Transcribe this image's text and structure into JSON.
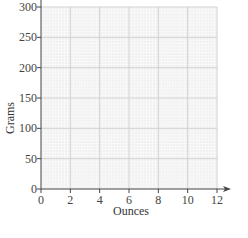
{
  "chart_data": {
    "type": "line",
    "title": "",
    "xlabel": "Ounces",
    "ylabel": "Grams",
    "xlim": [
      0,
      12
    ],
    "ylim": [
      0,
      300
    ],
    "x_ticks": [
      0,
      2,
      4,
      6,
      8,
      10,
      12
    ],
    "y_ticks": [
      0,
      50,
      100,
      150,
      200,
      250,
      300
    ],
    "x_tick_labels": [
      "0",
      "2",
      "4",
      "6",
      "8",
      "10",
      "12"
    ],
    "y_tick_labels": [
      "0",
      "50",
      "100",
      "150",
      "200",
      "250",
      "300"
    ],
    "grid": true,
    "grid_style": "graph paper: major lines every 2 ounces and 50 grams, with fine minor subdivisions",
    "x_axis_arrow": true,
    "legend": null,
    "series": []
  },
  "colors": {
    "background": "#ffffff",
    "plot_area": "#f1f1f1",
    "minor_grid": "#fafafa",
    "major_grid": "#d2d2d2",
    "axis": "#444444"
  }
}
